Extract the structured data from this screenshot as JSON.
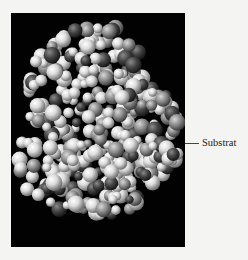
{
  "figure": {
    "background_color": "#020202",
    "atom_colors": {
      "light": "#e6e6e6",
      "medium": "#9a9a9a",
      "dark": "#3a3a3a"
    },
    "annotation": {
      "label": "Substrat"
    }
  }
}
